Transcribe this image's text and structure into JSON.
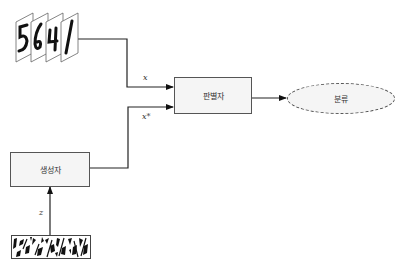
{
  "diagram": {
    "type": "GAN architecture",
    "nodes": {
      "real_images": {
        "description": "stack of handwritten digit images",
        "digits": [
          "5",
          "6",
          "4",
          "1"
        ]
      },
      "discriminator": {
        "label": "판별자"
      },
      "generator": {
        "label": "생성자"
      },
      "classification": {
        "label": "분류"
      },
      "noise": {
        "description": "random noise image"
      }
    },
    "edges": {
      "real_to_discriminator": {
        "label": "x"
      },
      "generator_to_discriminator": {
        "label": "x*"
      },
      "noise_to_generator": {
        "label": "z"
      },
      "discriminator_to_classification": {
        "label": ""
      }
    },
    "colors": {
      "stroke": "#222222",
      "box_fill": "#f5f5f5",
      "box_border": "#555555"
    }
  }
}
